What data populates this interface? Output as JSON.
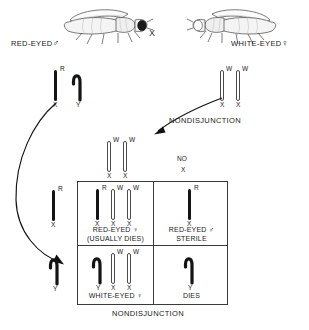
{
  "diagram": {
    "title_present": false,
    "cross_symbol": "X",
    "parents": {
      "male": {
        "label": "RED-EYED",
        "sex_symbol": "♂",
        "icon": "fruit-fly-dark-eye",
        "genotype_alleles": [
          "R"
        ],
        "chromosomes": [
          {
            "type": "X",
            "allele": "R",
            "shade": "dark",
            "base_label": "X"
          },
          {
            "type": "Y",
            "allele": "",
            "shade": "dark",
            "base_label": "Y"
          }
        ]
      },
      "female": {
        "label": "WHITE-EYED",
        "sex_symbol": "♀",
        "icon": "fruit-fly-light-eye",
        "genotype_alleles": [
          "W",
          "W"
        ],
        "chromosomes": [
          {
            "type": "X",
            "allele": "W",
            "shade": "light",
            "base_label": "X"
          },
          {
            "type": "X",
            "allele": "W",
            "shade": "light",
            "base_label": "X"
          }
        ]
      }
    },
    "events": {
      "nondisjunction_top": "NONDISJUNCTION",
      "nondisjunction_bottom": "NONDISJUNCTION"
    },
    "egg_gametes": {
      "xx": {
        "chromosomes": [
          {
            "type": "X",
            "allele": "W",
            "shade": "light",
            "base_label": "X"
          },
          {
            "type": "X",
            "allele": "W",
            "shade": "light",
            "base_label": "X"
          }
        ]
      },
      "no_x": {
        "line1": "NO",
        "line2": "X"
      }
    },
    "sperm_gametes": {
      "x_r": {
        "chromosomes": [
          {
            "type": "X",
            "allele": "R",
            "shade": "dark",
            "base_label": "X"
          }
        ]
      },
      "y": {
        "chromosomes": [
          {
            "type": "Y",
            "allele": "",
            "shade": "dark",
            "base_label": "Y"
          }
        ]
      }
    },
    "offspring": [
      {
        "cell": "top-left",
        "chromosomes": [
          {
            "type": "X",
            "allele": "R",
            "shade": "dark",
            "base_label": "X"
          },
          {
            "type": "X",
            "allele": "W",
            "shade": "light",
            "base_label": "X"
          },
          {
            "type": "X",
            "allele": "W",
            "shade": "light",
            "base_label": "X"
          }
        ],
        "caption_line1": "RED-EYED ♀",
        "caption_line2": "(USUALLY DIES)"
      },
      {
        "cell": "top-right",
        "chromosomes": [
          {
            "type": "X",
            "allele": "R",
            "shade": "dark",
            "base_label": "X"
          }
        ],
        "caption_line1": "RED-EYED ♂",
        "caption_line2": "STERILE"
      },
      {
        "cell": "bottom-left",
        "chromosomes": [
          {
            "type": "Y",
            "allele": "",
            "shade": "dark",
            "base_label": "Y"
          },
          {
            "type": "X",
            "allele": "W",
            "shade": "light",
            "base_label": "X"
          },
          {
            "type": "X",
            "allele": "W",
            "shade": "light",
            "base_label": "X"
          }
        ],
        "caption_line1": "WHITE-EYED ♀",
        "caption_line2": ""
      },
      {
        "cell": "bottom-right",
        "chromosomes": [
          {
            "type": "Y",
            "allele": "",
            "shade": "dark",
            "base_label": "Y"
          }
        ],
        "caption_line1": "DIES",
        "caption_line2": ""
      }
    ],
    "colors": {
      "ink": "#141414",
      "outline": "#4a4a4a",
      "grid": "#3a3a3a",
      "background": "#ffffff"
    }
  }
}
